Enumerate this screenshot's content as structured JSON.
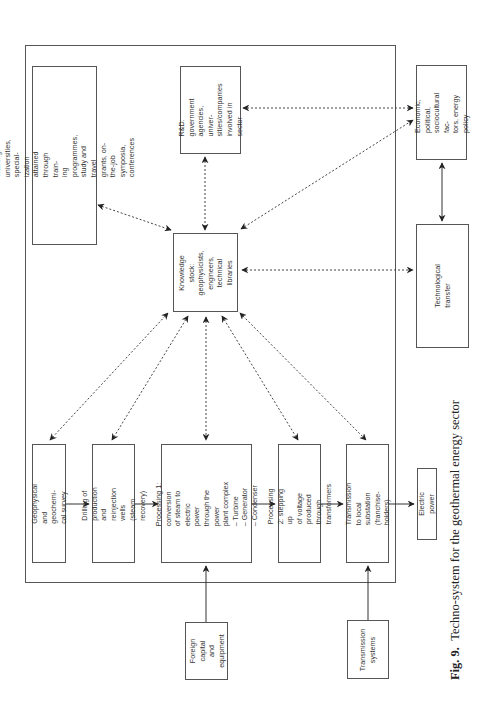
{
  "figure": {
    "caption_label": "Fig. 9.",
    "caption_text": "Techno-system for the geothermal energy sector"
  },
  "nodes": {
    "training": "Training: universities, special-\nization attained through train-\ning programmes, study and travel\ngrants, on-the-job symposia,\nconferences",
    "rnd": "R&D: government\nagencies, univer-\nsities/companies\ninvolved in sector",
    "economic": "Economic, political,\nsociocultural fac-\ntors, energy policy",
    "knowledge": "Knowledge\nstock:\ngeophysicists,\nengineers,\ntechnical libraries",
    "tech_transfer": "Technological transfer",
    "geophysical": "Geophysical and geochemi-\ncal survey",
    "drilling": "Drilling of production and\nreinjection wells (steam\nrecovery)",
    "processing1": "Processing 1: conversion\nof steam to electric\npower through the power\nplant complex\n– Turbine\n– Generator\n– Condenser",
    "processing2": "Processing 2: stepping up\nof voltage produced through\ntransformers",
    "transmission_local": "Transmission to local\nsubstation\n(franchise-holders)",
    "electric_power": "Electric power",
    "foreign_capital": "Foreign\ncapital and\nequipment",
    "transmission_systems": "Transmission\nsystems"
  },
  "edges": [
    {
      "from": "training",
      "to": "knowledge",
      "style": "dotted",
      "direction": "both"
    },
    {
      "from": "rnd",
      "to": "knowledge",
      "style": "dotted",
      "direction": "both"
    },
    {
      "from": "rnd",
      "to": "economic",
      "style": "dotted",
      "direction": "both"
    },
    {
      "from": "knowledge",
      "to": "economic",
      "style": "dotted",
      "direction": "both"
    },
    {
      "from": "knowledge",
      "to": "tech_transfer",
      "style": "dotted",
      "direction": "both"
    },
    {
      "from": "economic",
      "to": "tech_transfer",
      "style": "solid",
      "direction": "both"
    },
    {
      "from": "knowledge",
      "to": "geophysical",
      "style": "dotted",
      "direction": "both"
    },
    {
      "from": "knowledge",
      "to": "drilling",
      "style": "dotted",
      "direction": "both"
    },
    {
      "from": "knowledge",
      "to": "processing1",
      "style": "dotted",
      "direction": "both"
    },
    {
      "from": "knowledge",
      "to": "processing2",
      "style": "dotted",
      "direction": "both"
    },
    {
      "from": "knowledge",
      "to": "transmission_local",
      "style": "dotted",
      "direction": "both"
    },
    {
      "from": "geophysical",
      "to": "drilling",
      "style": "solid",
      "direction": "forward"
    },
    {
      "from": "drilling",
      "to": "processing1",
      "style": "solid",
      "direction": "forward"
    },
    {
      "from": "processing1",
      "to": "processing2",
      "style": "solid",
      "direction": "forward"
    },
    {
      "from": "processing2",
      "to": "transmission_local",
      "style": "solid",
      "direction": "forward"
    },
    {
      "from": "transmission_local",
      "to": "electric_power",
      "style": "solid",
      "direction": "forward"
    },
    {
      "from": "foreign_capital",
      "to": "processing1",
      "style": "solid",
      "direction": "forward"
    },
    {
      "from": "transmission_systems",
      "to": "transmission_local",
      "style": "solid",
      "direction": "forward"
    }
  ]
}
